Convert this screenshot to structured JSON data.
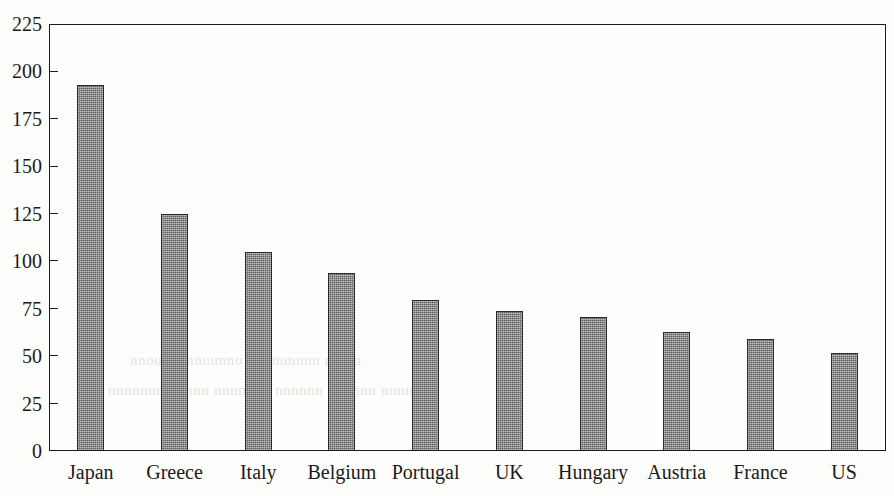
{
  "chart_data": {
    "type": "bar",
    "title": "",
    "subtitle": "",
    "xlabel": "",
    "ylabel": "",
    "categories": [
      "Japan",
      "Greece",
      "Italy",
      "Belgium",
      "Portugal",
      "UK",
      "Hungary",
      "Austria",
      "France",
      "US"
    ],
    "values": [
      193,
      125,
      105,
      94,
      79.5,
      74,
      70.5,
      62.5,
      59,
      51.5
    ],
    "ylim": [
      0,
      225
    ],
    "yticks": [
      0,
      25,
      50,
      75,
      100,
      125,
      150,
      175,
      200,
      225
    ],
    "ytick_labels": [
      "0",
      "25",
      "50",
      "75",
      "100",
      "125",
      "150",
      "175",
      "200",
      "225"
    ],
    "grid": false,
    "legend": null,
    "legend_position": "none",
    "bar_color": "#7e7e7e",
    "bar_edge_color": "#2a2a2a",
    "axis_color": "#1b1b1b",
    "background_color": "#fdfdfc"
  },
  "scan_artifacts": {
    "bleed_text_line_1": "nnoun amnuunno nunnunnnn nn nn",
    "bleed_text_line_2": "nnnnnunn nnnn nnnnnnn nnnnnn nnnnnn nnnnnnn"
  }
}
